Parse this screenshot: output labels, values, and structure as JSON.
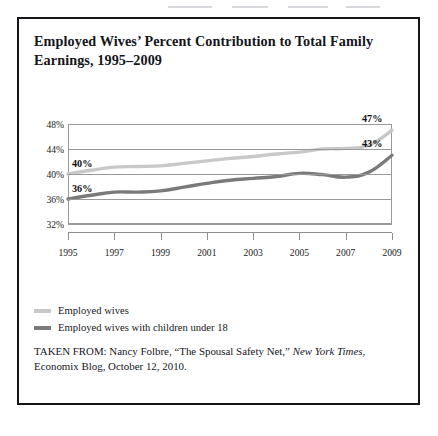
{
  "figure": {
    "title": "Employed Wives’ Percent Contribution to Total Family Earnings, 1995–2009"
  },
  "legend": {
    "items": [
      {
        "label": "Employed wives",
        "color": "#c8c8c8",
        "swatch_name": "legend-swatch-employed-wives"
      },
      {
        "label": "Employed wives with children under 18",
        "color": "#7a7a7a",
        "swatch_name": "legend-swatch-employed-wives-children"
      }
    ]
  },
  "source": {
    "prefix": "TAKEN FROM: Nancy Folbre, “The Spousal Safety Net,” ",
    "publication": "New York Times",
    "suffix": ", Economix Blog, October 12, 2010."
  },
  "chart_data": {
    "type": "line",
    "title": "Employed Wives’ Percent Contribution to Total Family Earnings, 1995–2009",
    "xlabel": "",
    "ylabel": "",
    "xlim": [
      1995,
      2009
    ],
    "ylim": [
      30,
      48
    ],
    "yticks": [
      "32%",
      "36%",
      "40%",
      "44%",
      "48%"
    ],
    "ytick_values": [
      32,
      36,
      40,
      44,
      48
    ],
    "xticks": [
      "1995",
      "1997",
      "1999",
      "2001",
      "2003",
      "2005",
      "2007",
      "2009"
    ],
    "xtick_values": [
      1995,
      1997,
      1999,
      2001,
      2003,
      2005,
      2007,
      2009
    ],
    "grid": true,
    "legend_position": "below",
    "x": [
      1995,
      1996,
      1997,
      1998,
      1999,
      2000,
      2001,
      2002,
      2003,
      2004,
      2005,
      2006,
      2007,
      2008,
      2009
    ],
    "series": [
      {
        "name": "Employed wives",
        "color": "#c8c8c8",
        "values": [
          40.0,
          40.6,
          41.1,
          41.2,
          41.3,
          41.7,
          42.1,
          42.5,
          42.8,
          43.2,
          43.5,
          44.0,
          44.1,
          44.6,
          47.0
        ],
        "start_label": "40%",
        "end_label": "47%"
      },
      {
        "name": "Employed wives with children under 18",
        "color": "#7a7a7a",
        "values": [
          36.0,
          36.6,
          37.1,
          37.1,
          37.3,
          37.9,
          38.5,
          39.0,
          39.3,
          39.6,
          40.1,
          39.9,
          39.5,
          40.3,
          43.0
        ],
        "start_label": "36%",
        "end_label": "43%"
      }
    ],
    "annotations": [
      {
        "text": "40%",
        "series": "Employed wives",
        "at_x": 1995,
        "at_y": 40
      },
      {
        "text": "47%",
        "series": "Employed wives",
        "at_x": 2009,
        "at_y": 47
      },
      {
        "text": "36%",
        "series": "Employed wives with children under 18",
        "at_x": 1995,
        "at_y": 36
      },
      {
        "text": "43%",
        "series": "Employed wives with children under 18",
        "at_x": 2009,
        "at_y": 43
      }
    ]
  }
}
